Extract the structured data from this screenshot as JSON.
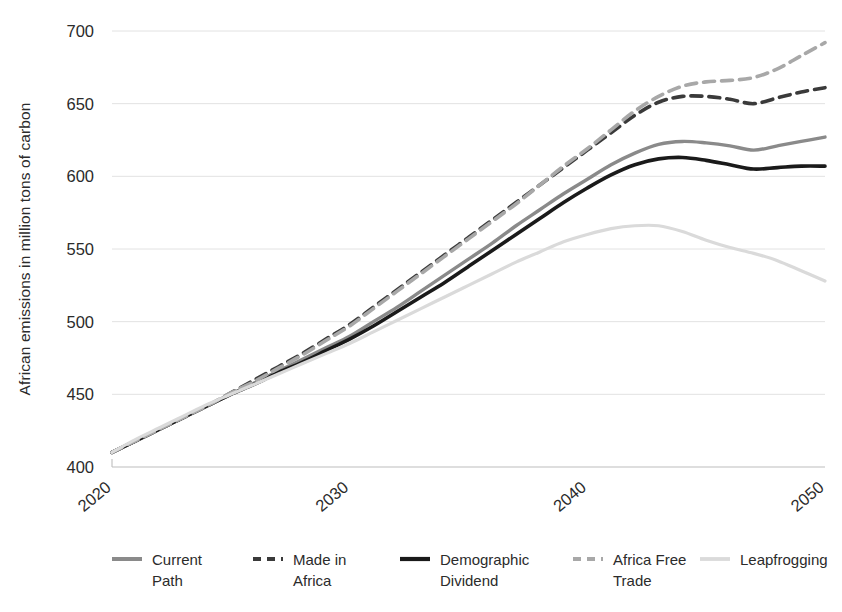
{
  "chart_data": {
    "type": "line",
    "title": "",
    "xlabel": "",
    "ylabel": "African emissions in million tons of carbon",
    "xlim": [
      2020,
      2050
    ],
    "ylim": [
      400,
      700
    ],
    "ytick_values": [
      400,
      450,
      500,
      550,
      600,
      650,
      700
    ],
    "ytick_labels": [
      "400",
      "450",
      "500",
      "550",
      "600",
      "650",
      "700"
    ],
    "xtick_values": [
      2020,
      2030,
      2040,
      2050
    ],
    "xtick_labels": [
      "2020",
      "2030",
      "2040",
      "2050"
    ],
    "grid": true,
    "legend_position": "bottom",
    "x": [
      2020,
      2021,
      2022,
      2023,
      2024,
      2025,
      2026,
      2027,
      2028,
      2029,
      2030,
      2031,
      2032,
      2033,
      2034,
      2035,
      2036,
      2037,
      2038,
      2039,
      2040,
      2041,
      2042,
      2043,
      2044,
      2045,
      2046,
      2047,
      2048,
      2049,
      2050
    ],
    "series": [
      {
        "name": "Current Path",
        "color": "#8a8a8a",
        "dash": "solid",
        "width": 3.4,
        "values": [
          410,
          418,
          426,
          434,
          442,
          450,
          458,
          466,
          474,
          482,
          490,
          500,
          510,
          521,
          532,
          543,
          554,
          566,
          577,
          588,
          598,
          608,
          616,
          622,
          624,
          623,
          621,
          618,
          621,
          624,
          627
        ]
      },
      {
        "name": "Made in Africa",
        "color": "#3a3a3a",
        "dash": "dashed",
        "width": 3.6,
        "values": [
          410,
          418,
          426,
          434,
          442,
          451,
          460,
          469,
          478,
          488,
          498,
          510,
          522,
          534,
          546,
          558,
          570,
          582,
          594,
          606,
          618,
          630,
          642,
          651,
          655,
          655,
          653,
          650,
          654,
          658,
          661
        ]
      },
      {
        "name": "Demographic Dividend",
        "color": "#1a1a1a",
        "dash": "solid",
        "width": 3.6,
        "values": [
          410,
          418,
          426,
          434,
          442,
          450,
          457,
          465,
          472,
          480,
          488,
          497,
          507,
          517,
          527,
          538,
          549,
          560,
          571,
          582,
          592,
          601,
          608,
          612,
          613,
          611,
          608,
          605,
          606,
          607,
          607
        ]
      },
      {
        "name": "Africa Free Trade",
        "color": "#a8a8a8",
        "dash": "dashed",
        "width": 3.6,
        "values": [
          410,
          418,
          426,
          434,
          442,
          451,
          459,
          468,
          477,
          487,
          497,
          509,
          521,
          533,
          545,
          557,
          569,
          581,
          594,
          607,
          619,
          632,
          645,
          655,
          662,
          665,
          666,
          668,
          674,
          683,
          692
        ]
      },
      {
        "name": "Leapfrogging",
        "color": "#dadada",
        "dash": "solid",
        "width": 3.2,
        "values": [
          410,
          419,
          427,
          435,
          443,
          450,
          457,
          464,
          471,
          478,
          485,
          493,
          501,
          509,
          517,
          525,
          533,
          541,
          548,
          555,
          560,
          564,
          566,
          566,
          562,
          556,
          551,
          547,
          542,
          535,
          528
        ]
      }
    ]
  },
  "legend": {
    "items": [
      {
        "label_line1": "Current",
        "label_line2": "Path"
      },
      {
        "label_line1": "Made in",
        "label_line2": "Africa"
      },
      {
        "label_line1": "Demographic",
        "label_line2": "Dividend"
      },
      {
        "label_line1": "Africa Free",
        "label_line2": "Trade"
      },
      {
        "label_line1": "Leapfrogging",
        "label_line2": ""
      }
    ]
  }
}
